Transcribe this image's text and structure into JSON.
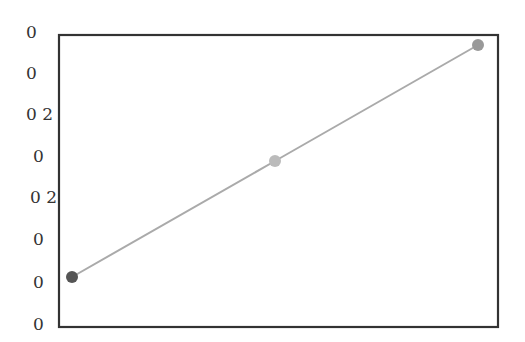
{
  "chart_data": {
    "type": "line",
    "title": "",
    "xlabel": "",
    "ylabel": "",
    "x": [
      0,
      1,
      2
    ],
    "series": [
      {
        "name": "",
        "values": [
          0,
          0.5,
          1
        ],
        "marker_colors": [
          "#555555",
          "#bbbbbb",
          "#999999"
        ],
        "line_color": "#aaaaaa"
      }
    ],
    "ytick_labels": [
      "0",
      "0",
      "0 2",
      "0",
      "0 2",
      "0",
      "0",
      "0"
    ],
    "xtick_labels": [],
    "grid": false,
    "legend": null,
    "frame": true
  },
  "colors": {
    "frame": "#333333",
    "line": "#aaaaaa",
    "text": "#333333"
  }
}
